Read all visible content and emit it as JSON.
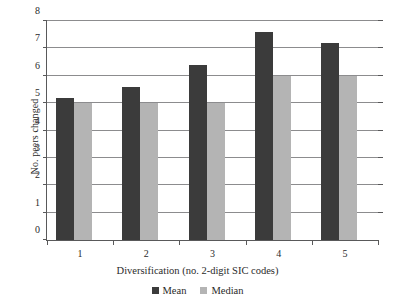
{
  "chart_data": {
    "type": "bar",
    "title": "",
    "xlabel": "Diversification (no. 2-digit SIC codes)",
    "ylabel": "No. peers changed",
    "categories": [
      "1",
      "2",
      "3",
      "4",
      "5"
    ],
    "series": [
      {
        "name": "Mean",
        "color": "#3b3b3b",
        "values": [
          5.2,
          5.6,
          6.4,
          7.6,
          7.2
        ]
      },
      {
        "name": "Median",
        "color": "#b4b4b4",
        "values": [
          5.0,
          5.0,
          5.0,
          6.0,
          6.0
        ]
      }
    ],
    "ylim": [
      0,
      8
    ],
    "yticks": [
      "0",
      "1",
      "2",
      "3",
      "4",
      "5",
      "6",
      "7",
      "8"
    ],
    "grid": "horizontal",
    "legend_position": "bottom"
  }
}
